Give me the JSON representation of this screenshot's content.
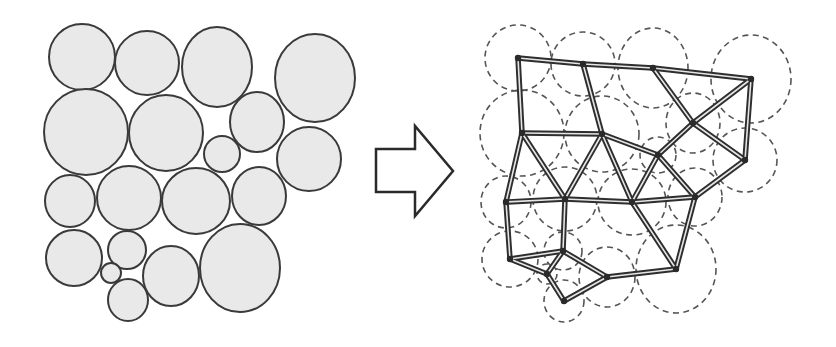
{
  "diagram": {
    "colors": {
      "circle_fill": "#e9e9e9",
      "circle_stroke": "#3a3a3a",
      "dashed_stroke": "#555555",
      "beam_outer": "#2e2e2e",
      "beam_inner": "#e6e6e6",
      "arrow_fill": "#ffffff",
      "arrow_stroke": "#2a2a2a"
    },
    "offset_right": [
      436,
      1
    ],
    "circles": [
      {
        "id": "A",
        "cx": 82,
        "cy": 57,
        "rx": 33,
        "ry": 33
      },
      {
        "id": "B",
        "cx": 147,
        "cy": 63,
        "rx": 32,
        "ry": 32
      },
      {
        "id": "C",
        "cx": 217,
        "cy": 67,
        "rx": 35,
        "ry": 40
      },
      {
        "id": "D",
        "cx": 315,
        "cy": 78,
        "rx": 40,
        "ry": 44
      },
      {
        "id": "E",
        "cx": 86,
        "cy": 132,
        "rx": 42,
        "ry": 43
      },
      {
        "id": "F",
        "cx": 166,
        "cy": 133,
        "rx": 37,
        "ry": 38
      },
      {
        "id": "G",
        "cx": 257,
        "cy": 122,
        "rx": 27,
        "ry": 30
      },
      {
        "id": "H",
        "cx": 222,
        "cy": 154,
        "rx": 18,
        "ry": 18
      },
      {
        "id": "I",
        "cx": 309,
        "cy": 159,
        "rx": 32,
        "ry": 32
      },
      {
        "id": "J",
        "cx": 70,
        "cy": 201,
        "rx": 25,
        "ry": 26
      },
      {
        "id": "K",
        "cx": 129,
        "cy": 198,
        "rx": 32,
        "ry": 32
      },
      {
        "id": "L",
        "cx": 196,
        "cy": 201,
        "rx": 34,
        "ry": 33
      },
      {
        "id": "M",
        "cx": 259,
        "cy": 196,
        "rx": 27,
        "ry": 29
      },
      {
        "id": "N",
        "cx": 74,
        "cy": 258,
        "rx": 28,
        "ry": 28
      },
      {
        "id": "O",
        "cx": 127,
        "cy": 250,
        "rx": 19,
        "ry": 19
      },
      {
        "id": "P",
        "cx": 111,
        "cy": 273,
        "rx": 10,
        "ry": 10
      },
      {
        "id": "Q",
        "cx": 128,
        "cy": 300,
        "rx": 20,
        "ry": 21
      },
      {
        "id": "R",
        "cx": 171,
        "cy": 276,
        "rx": 28,
        "ry": 30
      },
      {
        "id": "S",
        "cx": 240,
        "cy": 268,
        "rx": 40,
        "ry": 44
      }
    ],
    "edges": [
      [
        "A",
        "B"
      ],
      [
        "A",
        "E"
      ],
      [
        "B",
        "C"
      ],
      [
        "B",
        "F"
      ],
      [
        "C",
        "D"
      ],
      [
        "C",
        "G"
      ],
      [
        "D",
        "G"
      ],
      [
        "D",
        "I"
      ],
      [
        "G",
        "I"
      ],
      [
        "G",
        "H"
      ],
      [
        "E",
        "F"
      ],
      [
        "E",
        "J"
      ],
      [
        "E",
        "K"
      ],
      [
        "F",
        "K"
      ],
      [
        "F",
        "L"
      ],
      [
        "F",
        "H"
      ],
      [
        "H",
        "L"
      ],
      [
        "H",
        "M"
      ],
      [
        "I",
        "M"
      ],
      [
        "J",
        "K"
      ],
      [
        "K",
        "L"
      ],
      [
        "L",
        "M"
      ],
      [
        "J",
        "N"
      ],
      [
        "K",
        "O"
      ],
      [
        "L",
        "S"
      ],
      [
        "M",
        "S"
      ],
      [
        "N",
        "O"
      ],
      [
        "N",
        "P"
      ],
      [
        "O",
        "P"
      ],
      [
        "O",
        "R"
      ],
      [
        "P",
        "Q"
      ],
      [
        "Q",
        "R"
      ],
      [
        "R",
        "S"
      ]
    ],
    "arrow": {
      "points": "376,149 415,149 415,126 453,171 415,216 415,192 376,192",
      "direction": "right"
    }
  }
}
